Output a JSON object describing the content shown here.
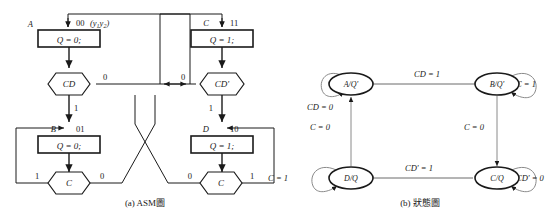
{
  "figure": {
    "captions": {
      "left": "(a) ASM圖",
      "right": "(b) 狀態圖"
    }
  },
  "asm": {
    "states": [
      {
        "name": "A",
        "code": "00",
        "code_note": "(y1y2)",
        "action": "Q = 0;",
        "decision": "CD",
        "branch_left": "0",
        "branch_right": "1"
      },
      {
        "name": "C",
        "code": "11",
        "code_note": "",
        "action": "Q = 1;",
        "decision": "CD'",
        "branch_left": "0",
        "branch_right": "1"
      },
      {
        "name": "B",
        "code": "01",
        "code_note": "",
        "action": "Q = 0;",
        "decision": "C",
        "branch_left": "1",
        "branch_right": "0"
      },
      {
        "name": "D",
        "code": "10",
        "code_note": "",
        "action": "Q = 1;",
        "decision": "C",
        "branch_left": "0",
        "branch_right": "1"
      }
    ],
    "labels": {
      "a_name": "A",
      "a_code": "00",
      "a_code_sub1": "(y",
      "a_code_sub2": "1",
      "a_code_sub3": "y",
      "a_code_sub4": "2",
      "a_code_sub5": ")",
      "a_action": "Q = 0;",
      "a_decision": "CD",
      "a_branch0": "0",
      "a_branch1": "1",
      "c_name": "C",
      "c_code": "11",
      "c_action": "Q = 1;",
      "c_decision": "CD'",
      "c_branch0": "0",
      "c_branch1": "1",
      "b_name": "B",
      "b_code": "01",
      "b_action": "Q = 0;",
      "b_decision": "C",
      "b_branch1": "1",
      "b_branch0": "0",
      "d_name": "D",
      "d_code": "10",
      "d_action": "Q = 1;",
      "d_decision": "C",
      "d_branch0": "0",
      "d_branch1": "1"
    }
  },
  "state_diagram": {
    "nodes": [
      {
        "id": "A",
        "label": "A/Q'"
      },
      {
        "id": "B",
        "label": "B/Q'"
      },
      {
        "id": "C",
        "label": "C/Q"
      },
      {
        "id": "D",
        "label": "D/Q"
      }
    ],
    "edges": [
      {
        "from": "A",
        "to": "A",
        "label": "CD = 0",
        "type": "self"
      },
      {
        "from": "A",
        "to": "B",
        "label": "CD = 1",
        "type": "transition"
      },
      {
        "from": "B",
        "to": "B",
        "label": "C = 1",
        "type": "self"
      },
      {
        "from": "B",
        "to": "C",
        "label": "C = 0",
        "type": "transition"
      },
      {
        "from": "C",
        "to": "C",
        "label": "CD' = 0",
        "type": "self"
      },
      {
        "from": "C",
        "to": "D",
        "label": "CD' = 1",
        "type": "transition"
      },
      {
        "from": "D",
        "to": "D",
        "label": "C = 1",
        "type": "self"
      },
      {
        "from": "D",
        "to": "A",
        "label": "C = 0",
        "type": "transition"
      }
    ],
    "labels": {
      "node_a": "A/Q'",
      "node_b": "B/Q'",
      "node_c": "C/Q",
      "node_d": "D/Q",
      "edge_a_self": "CD = 0",
      "edge_a_b": "CD = 1",
      "edge_b_self": "C = 1",
      "edge_b_c": "C = 0",
      "edge_c_self": "CD' = 0",
      "edge_c_d": "CD' = 1",
      "edge_d_self": "C = 1",
      "edge_d_a": "C = 0"
    }
  },
  "colors": {
    "line": "#1a1a1a",
    "thin": "#6b6b6b",
    "text": "#1a1a1a",
    "background": "#ffffff"
  }
}
